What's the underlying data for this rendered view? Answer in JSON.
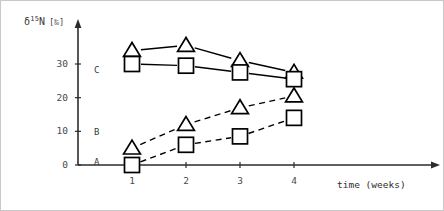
{
  "chart_data": {
    "type": "line",
    "title": "",
    "ylabel": "δ¹⁵N [‰]",
    "ylabel_parts": {
      "delta": "δ",
      "mass": "15",
      "element": "N",
      "unit": "[‰]"
    },
    "xlabel": "time (weeks)",
    "x": [
      1,
      2,
      3,
      4
    ],
    "xtick_labels": [
      "1",
      "2",
      "3",
      "4"
    ],
    "ytick_labels": [
      "0",
      "10",
      "20",
      "30"
    ],
    "ytick_values": [
      0,
      10,
      20,
      30
    ],
    "xlim": [
      0.55,
      4.8
    ],
    "ylim": [
      -4,
      38
    ],
    "grid": false,
    "legend": "inline-left-labels",
    "series": [
      {
        "name": "C-triangle",
        "group": "C",
        "marker": "triangle",
        "linestyle": "solid",
        "values": [
          34,
          35.5,
          31,
          27.5
        ]
      },
      {
        "name": "C-square",
        "group": "C",
        "marker": "square",
        "linestyle": "solid",
        "values": [
          30,
          29.5,
          27.5,
          25.5
        ]
      },
      {
        "name": "B-triangle",
        "group": "B",
        "marker": "triangle",
        "linestyle": "dashed",
        "values": [
          5,
          12,
          17,
          20.5
        ]
      },
      {
        "name": "A-square",
        "group": "A",
        "marker": "square",
        "linestyle": "dashed",
        "values": [
          0,
          6,
          8.5,
          14
        ]
      }
    ],
    "group_labels": [
      {
        "label": "C",
        "y": 28
      },
      {
        "label": "B",
        "y": 9.5
      },
      {
        "label": "A",
        "y": 0.5
      }
    ],
    "colors": {
      "ink": "#000000",
      "axis": "#2b2b2b",
      "text": "#3a3a3a",
      "frame": "#c8c8c8"
    }
  }
}
